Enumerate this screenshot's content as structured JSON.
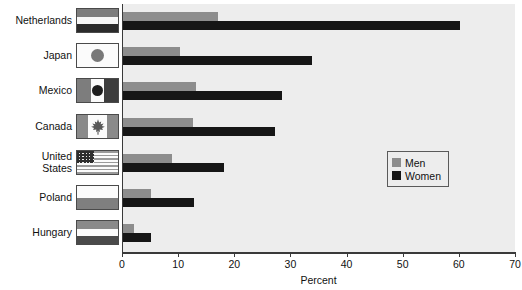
{
  "chart_data": {
    "type": "bar",
    "orientation": "horizontal",
    "title": "",
    "xlabel": "Percent",
    "ylabel": "",
    "xlim": [
      0,
      70
    ],
    "xticks": [
      0,
      10,
      20,
      30,
      40,
      50,
      60,
      70
    ],
    "xticklabels": [
      "0",
      "10",
      "20",
      "30",
      "40",
      "50",
      "60",
      "70"
    ],
    "grid": false,
    "legend_position": "right-middle",
    "categories": [
      "Netherlands",
      "Japan",
      "Mexico",
      "Canada",
      "United\nStates",
      "Poland",
      "Hungary"
    ],
    "series": [
      {
        "name": "Men",
        "color": "#8d8d8d",
        "values": [
          17,
          10.2,
          13,
          12.5,
          8.8,
          5,
          2
        ]
      },
      {
        "name": "Women",
        "color": "#161616",
        "values": [
          60,
          33.7,
          28.4,
          27,
          18,
          12.7,
          5
        ]
      }
    ]
  },
  "legend": {
    "entries": [
      {
        "label": "Men",
        "swatch_color": "#8d8d8d"
      },
      {
        "label": "Women",
        "swatch_color": "#161616"
      }
    ]
  },
  "axis": {
    "x_title": "Percent",
    "tick_labels": [
      "0",
      "10",
      "20",
      "30",
      "40",
      "50",
      "60",
      "70"
    ]
  },
  "rows": [
    {
      "label": "Netherlands",
      "flag": "flag-netherlands",
      "men": 17,
      "women": 60
    },
    {
      "label": "Japan",
      "flag": "flag-japan",
      "men": 10.2,
      "women": 33.7
    },
    {
      "label": "Mexico",
      "flag": "flag-mexico",
      "men": 13,
      "women": 28.4
    },
    {
      "label": "Canada",
      "flag": "flag-canada",
      "men": 12.5,
      "women": 27
    },
    {
      "label": "United\nStates",
      "flag": "flag-united-states",
      "men": 8.8,
      "women": 18
    },
    {
      "label": "Poland",
      "flag": "flag-poland",
      "men": 5,
      "women": 12.7
    },
    {
      "label": "Hungary",
      "flag": "flag-hungary",
      "men": 2,
      "women": 5
    }
  ],
  "colors": {
    "men": "#8d8d8d",
    "women": "#161616",
    "plot_background": "#ededed",
    "axis": "#3a3a3a",
    "page_background": "#ffffff"
  }
}
